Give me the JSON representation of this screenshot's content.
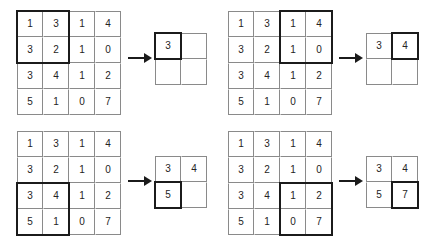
{
  "figure": {
    "matrix_label": "input-matrix",
    "output_label": "output-matrix",
    "arrow_label": "maps-to-arrow"
  },
  "source_matrix": {
    "rows": 4,
    "cols": 4,
    "values": [
      [
        1,
        3,
        1,
        4
      ],
      [
        3,
        2,
        1,
        0
      ],
      [
        3,
        4,
        1,
        2
      ],
      [
        5,
        1,
        0,
        7
      ]
    ]
  },
  "steps": [
    {
      "id": "step-1",
      "window": {
        "row": 0,
        "col": 0,
        "size": 2
      },
      "input": {
        "values": [
          [
            1,
            3,
            1,
            4
          ],
          [
            3,
            2,
            1,
            0
          ],
          [
            3,
            4,
            1,
            2
          ],
          [
            5,
            1,
            0,
            7
          ]
        ],
        "highlight": {
          "row": 0,
          "col": 0,
          "rowspan": 2,
          "colspan": 2
        }
      },
      "output": {
        "values": [
          [
            "3",
            ""
          ],
          [
            "",
            ""
          ]
        ],
        "highlight": {
          "row": 0,
          "col": 0,
          "rowspan": 1,
          "colspan": 1
        }
      }
    },
    {
      "id": "step-2",
      "window": {
        "row": 0,
        "col": 2,
        "size": 2
      },
      "input": {
        "values": [
          [
            1,
            3,
            1,
            4
          ],
          [
            3,
            2,
            1,
            0
          ],
          [
            3,
            4,
            1,
            2
          ],
          [
            5,
            1,
            0,
            7
          ]
        ],
        "highlight": {
          "row": 0,
          "col": 2,
          "rowspan": 2,
          "colspan": 2
        }
      },
      "output": {
        "values": [
          [
            "3",
            "4"
          ],
          [
            "",
            ""
          ]
        ],
        "highlight": {
          "row": 0,
          "col": 1,
          "rowspan": 1,
          "colspan": 1
        }
      }
    },
    {
      "id": "step-3",
      "window": {
        "row": 2,
        "col": 0,
        "size": 2
      },
      "input": {
        "values": [
          [
            1,
            3,
            1,
            4
          ],
          [
            3,
            2,
            1,
            0
          ],
          [
            3,
            4,
            1,
            2
          ],
          [
            5,
            1,
            0,
            7
          ]
        ],
        "highlight": {
          "row": 2,
          "col": 0,
          "rowspan": 2,
          "colspan": 2
        }
      },
      "output": {
        "values": [
          [
            "3",
            "4"
          ],
          [
            "5",
            ""
          ]
        ],
        "highlight": {
          "row": 1,
          "col": 0,
          "rowspan": 1,
          "colspan": 1
        }
      }
    },
    {
      "id": "step-4",
      "window": {
        "row": 2,
        "col": 2,
        "size": 2
      },
      "input": {
        "values": [
          [
            1,
            3,
            1,
            4
          ],
          [
            3,
            2,
            1,
            0
          ],
          [
            3,
            4,
            1,
            2
          ],
          [
            5,
            1,
            0,
            7
          ]
        ],
        "highlight": {
          "row": 2,
          "col": 2,
          "rowspan": 2,
          "colspan": 2
        }
      },
      "output": {
        "values": [
          [
            "3",
            "4"
          ],
          [
            "5",
            "7"
          ]
        ],
        "highlight": {
          "row": 1,
          "col": 1,
          "rowspan": 1,
          "colspan": 1
        }
      }
    }
  ],
  "colors": {
    "grid_line": "#8a8a8a",
    "highlight_border": "#1b1b1b",
    "text": "#242424",
    "background": "#ffffff"
  },
  "layout": {
    "cell_size": 26,
    "positions": {
      "step-1": {
        "input": [
          17,
          11
        ],
        "arrow": [
          128,
          53
        ],
        "output": [
          155,
          33
        ]
      },
      "step-2": {
        "input": [
          228,
          11
        ],
        "arrow": [
          339,
          53
        ],
        "output": [
          366,
          33
        ]
      },
      "step-3": {
        "input": [
          17,
          131
        ],
        "arrow": [
          128,
          176
        ],
        "output": [
          155,
          156
        ]
      },
      "step-4": {
        "input": [
          228,
          131
        ],
        "arrow": [
          339,
          176
        ],
        "output": [
          366,
          156
        ]
      }
    }
  }
}
